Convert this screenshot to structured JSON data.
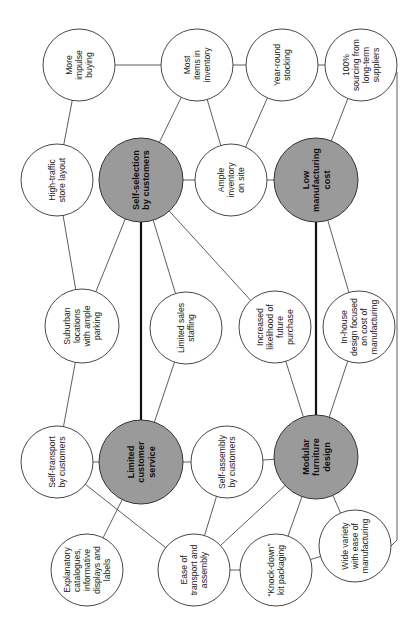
{
  "diagram": {
    "title": "",
    "orientation": "rotated 90° counter-clockwise",
    "colors": {
      "core_fill": "#9a9a9a",
      "node_fill": "#ffffff",
      "stroke": "#333333"
    },
    "nodes": [
      {
        "id": "impulse",
        "lines": [
          "More",
          "impulse",
          "buying"
        ],
        "core": false,
        "x": 79,
        "y": 65,
        "r": 36
      },
      {
        "id": "most_items",
        "lines": [
          "Most",
          "items in",
          "inventory"
        ],
        "core": false,
        "x": 197,
        "y": 65,
        "r": 36
      },
      {
        "id": "year_round",
        "lines": [
          "Year-round",
          "stocking"
        ],
        "core": false,
        "x": 282,
        "y": 65,
        "r": 36
      },
      {
        "id": "sourcing",
        "lines": [
          "100%",
          "sourcing from",
          "long-term",
          "suppliers"
        ],
        "core": false,
        "x": 361,
        "y": 65,
        "r": 36
      },
      {
        "id": "high_traffic",
        "lines": [
          "High-traffic",
          "store layout"
        ],
        "core": false,
        "x": 57,
        "y": 180,
        "r": 36
      },
      {
        "id": "self_selection",
        "lines": [
          "Self-selection",
          "by customers"
        ],
        "core": true,
        "x": 141,
        "y": 180,
        "r": 42
      },
      {
        "id": "ample",
        "lines": [
          "Ample",
          "inventory",
          "on site"
        ],
        "core": false,
        "x": 231,
        "y": 180,
        "r": 36
      },
      {
        "id": "low_cost",
        "lines": [
          "Low",
          "manufacturing",
          "cost"
        ],
        "core": true,
        "x": 316,
        "y": 180,
        "r": 42
      },
      {
        "id": "suburban",
        "lines": [
          "Suburban",
          "locations",
          "with ample",
          "parking"
        ],
        "core": false,
        "x": 82,
        "y": 326,
        "r": 37
      },
      {
        "id": "sales_staff",
        "lines": [
          "Limited sales",
          "staffing"
        ],
        "core": false,
        "x": 186,
        "y": 328,
        "r": 36
      },
      {
        "id": "future",
        "lines": [
          "Increased",
          "likelihood of",
          "future",
          "purchase"
        ],
        "core": false,
        "x": 275,
        "y": 327,
        "r": 36
      },
      {
        "id": "inhouse",
        "lines": [
          "In-house",
          "design focused",
          "on cost of",
          "manufacturing"
        ],
        "core": false,
        "x": 359,
        "y": 327,
        "r": 36
      },
      {
        "id": "self_transport",
        "lines": [
          "Self-transport",
          "by customers"
        ],
        "core": false,
        "x": 57,
        "y": 462,
        "r": 36
      },
      {
        "id": "limited_service",
        "lines": [
          "Limited",
          "customer",
          "service"
        ],
        "core": true,
        "x": 141,
        "y": 462,
        "r": 42
      },
      {
        "id": "self_assembly",
        "lines": [
          "Self-assembly",
          "by customers"
        ],
        "core": false,
        "x": 227,
        "y": 462,
        "r": 36
      },
      {
        "id": "modular",
        "lines": [
          "Modular",
          "furniture",
          "design"
        ],
        "core": true,
        "x": 316,
        "y": 457,
        "r": 42
      },
      {
        "id": "catalogues",
        "lines": [
          "Explanatory",
          "catalogues,",
          "informative",
          "displays and",
          "labels"
        ],
        "core": false,
        "x": 87,
        "y": 570,
        "r": 36
      },
      {
        "id": "ease",
        "lines": [
          "Ease of",
          "transport and",
          "assembly"
        ],
        "core": false,
        "x": 194,
        "y": 570,
        "r": 36
      },
      {
        "id": "knockdown",
        "lines": [
          "“Knock-down”",
          "kit packaging"
        ],
        "core": false,
        "x": 276,
        "y": 570,
        "r": 36
      },
      {
        "id": "wide_variety",
        "lines": [
          "Wide variety",
          "with ease of",
          "manufacturing"
        ],
        "core": false,
        "x": 355,
        "y": 546,
        "r": 36
      }
    ],
    "edges": [
      {
        "from": "impulse",
        "to": "most_items"
      },
      {
        "from": "impulse",
        "to": "high_traffic"
      },
      {
        "from": "most_items",
        "to": "year_round"
      },
      {
        "from": "year_round",
        "to": "sourcing"
      },
      {
        "from": "most_items",
        "to": "self_selection"
      },
      {
        "from": "most_items",
        "to": "ample"
      },
      {
        "from": "year_round",
        "to": "ample"
      },
      {
        "from": "sourcing",
        "to": "low_cost"
      },
      {
        "from": "self_selection",
        "to": "ample"
      },
      {
        "from": "ample",
        "to": "low_cost"
      },
      {
        "from": "high_traffic",
        "to": "suburban"
      },
      {
        "from": "self_selection",
        "to": "suburban"
      },
      {
        "from": "self_selection",
        "to": "sales_staff"
      },
      {
        "from": "self_selection",
        "to": "future"
      },
      {
        "from": "self_selection",
        "to": "limited_service",
        "strong": true
      },
      {
        "from": "low_cost",
        "to": "modular",
        "strong": true
      },
      {
        "from": "low_cost",
        "to": "inhouse"
      },
      {
        "from": "suburban",
        "to": "self_transport"
      },
      {
        "from": "sales_staff",
        "to": "limited_service"
      },
      {
        "from": "future",
        "to": "modular"
      },
      {
        "from": "inhouse",
        "to": "modular"
      },
      {
        "from": "self_transport",
        "to": "limited_service"
      },
      {
        "from": "limited_service",
        "to": "self_assembly"
      },
      {
        "from": "self_assembly",
        "to": "modular"
      },
      {
        "from": "limited_service",
        "to": "catalogues"
      },
      {
        "from": "self_transport",
        "to": "ease"
      },
      {
        "from": "self_assembly",
        "to": "ease"
      },
      {
        "from": "modular",
        "to": "ease"
      },
      {
        "from": "ease",
        "to": "knockdown"
      },
      {
        "from": "modular",
        "to": "knockdown"
      },
      {
        "from": "modular",
        "to": "wide_variety"
      },
      {
        "from": "knockdown",
        "to": "wide_variety"
      }
    ],
    "elbow_edges": [
      {
        "from": "sourcing",
        "to": "wide_variety",
        "points": [
          [
            397,
            72
          ],
          [
            397,
            540
          ],
          [
            391,
            546
          ]
        ]
      }
    ]
  }
}
